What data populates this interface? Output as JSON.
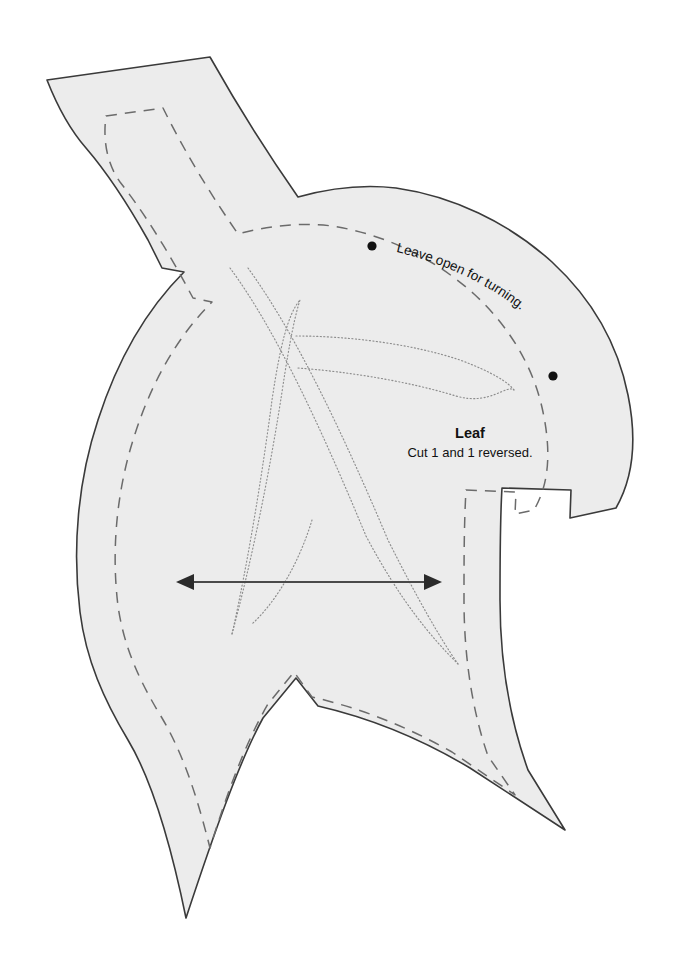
{
  "document": {
    "type": "sewing-pattern-sheet",
    "piece_name": "Leaf",
    "background_color": "#ffffff"
  },
  "piece": {
    "fill_color": "#ececec",
    "cut_line_color": "#3a3a3a",
    "seam_line_color": "#6b6b6b",
    "vein_line_color": "#8d8d8d"
  },
  "labels": {
    "title": "Leaf",
    "subtitle": "Cut 1 and 1 reversed.",
    "leave_open": "Leave open for turning."
  },
  "markings": {
    "grainline_arrow": "double-headed-arrow",
    "open_dot_count": 2,
    "seam_line_style": "dashed",
    "vein_line_style": "dotted"
  }
}
